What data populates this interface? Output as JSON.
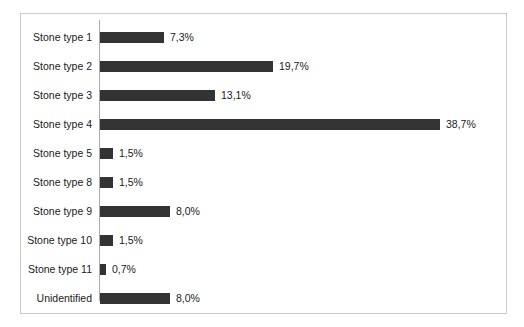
{
  "figure": {
    "background_color": "#ffffff",
    "frame_color": "#c9c9c9",
    "axis_line_color": "#aaaaaa",
    "bar_color": "#333333",
    "label_color": "#1a1a1a"
  },
  "chart_data": {
    "type": "bar",
    "orientation": "horizontal",
    "title": "",
    "subtitle": "",
    "xlabel": "",
    "ylabel": "",
    "grid": false,
    "legend": null,
    "xlim": [
      0,
      38.7
    ],
    "value_suffix": "%",
    "decimal_separator": ",",
    "categories": [
      "Stone type 1",
      "Stone type 2",
      "Stone type 3",
      "Stone type 4",
      "Stone type 5",
      "Stone type 8",
      "Stone type 9",
      "Stone type 10",
      "Stone type 11",
      "Unidentified"
    ],
    "values": [
      7.3,
      19.7,
      13.1,
      38.7,
      1.5,
      1.5,
      8.0,
      1.5,
      0.7,
      8.0
    ],
    "value_labels": [
      "7,3%",
      "19,7%",
      "13,1%",
      "38,7%",
      "1,5%",
      "1,5%",
      "8,0%",
      "1,5%",
      "0,7%",
      "8,0%"
    ],
    "bars": [
      {
        "category": "Stone type 1",
        "value": 7.3,
        "label": "7,3%",
        "bar_px": 64
      },
      {
        "category": "Stone type 2",
        "value": 19.7,
        "label": "19,7%",
        "bar_px": 173
      },
      {
        "category": "Stone type 3",
        "value": 13.1,
        "label": "13,1%",
        "bar_px": 115
      },
      {
        "category": "Stone type 4",
        "value": 38.7,
        "label": "38,7%",
        "bar_px": 340
      },
      {
        "category": "Stone type 5",
        "value": 1.5,
        "label": "1,5%",
        "bar_px": 13
      },
      {
        "category": "Stone type 8",
        "value": 1.5,
        "label": "1,5%",
        "bar_px": 13
      },
      {
        "category": "Stone type 9",
        "value": 8.0,
        "label": "8,0%",
        "bar_px": 70
      },
      {
        "category": "Stone type 10",
        "value": 1.5,
        "label": "1,5%",
        "bar_px": 13
      },
      {
        "category": "Stone type 11",
        "value": 0.7,
        "label": "0,7%",
        "bar_px": 6
      },
      {
        "category": "Unidentified",
        "value": 8.0,
        "label": "8,0%",
        "bar_px": 70
      }
    ]
  }
}
